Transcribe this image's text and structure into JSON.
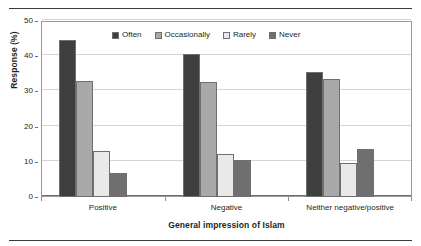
{
  "chart_data": {
    "type": "bar",
    "title": "",
    "xlabel": "General impression of Islam",
    "ylabel": "Response (%)",
    "categories": [
      "Positive",
      "Negative",
      "Neither negative/positive"
    ],
    "series": [
      {
        "name": "Often",
        "values": [
          44.6,
          40.6,
          35.4
        ],
        "color": "#3f3f3f"
      },
      {
        "name": "Occasionally",
        "values": [
          33.0,
          32.7,
          33.6
        ],
        "color": "#a9a9a9"
      },
      {
        "name": "Rarely",
        "values": [
          13.1,
          12.3,
          9.6
        ],
        "color": "#e9e9e9"
      },
      {
        "name": "Never",
        "values": [
          6.9,
          10.6,
          13.7
        ],
        "color": "#6f6f6f"
      }
    ],
    "ylim": [
      0,
      50
    ],
    "yticks": [
      0,
      10,
      20,
      30,
      40,
      50
    ],
    "ytick_labels": [
      "0",
      "10",
      "20",
      "30",
      "40",
      "50"
    ],
    "grid": true,
    "grid_axis": "y",
    "legend_position": "top-center",
    "bar_border_color": "#6f6f6f",
    "frame_color": "#9a9a9a"
  },
  "figure": {
    "top_rule": "",
    "bottom_rule": ""
  }
}
